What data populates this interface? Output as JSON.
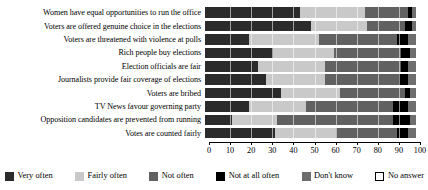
{
  "chart_data": {
    "type": "bar",
    "orientation": "horizontal",
    "stacked": true,
    "normalized_percent": true,
    "title": "",
    "subtitle": "",
    "xlabel": "",
    "ylabel": "",
    "xlim": [
      0,
      100
    ],
    "xticks": [
      0,
      10,
      20,
      30,
      40,
      50,
      60,
      70,
      80,
      90,
      100
    ],
    "xtick_labels": [
      "0",
      "10",
      "20",
      "30",
      "40",
      "50",
      "60",
      "70",
      "80",
      "90",
      "100"
    ],
    "grid": true,
    "legend_position": "bottom",
    "categories": [
      "Women have equal opportunities to run the office",
      "Voters are offered genuine choice in the elections",
      "Voters are threatened with violence at polls",
      "Rich people buy elections",
      "Election officials are fair",
      "Journalists provide fair coverage of elections",
      "Voters are bribed",
      "TV News favour governing party",
      "Opposition candidates are prevented from running",
      "Votes are counted fairly"
    ],
    "series": [
      {
        "name": "Very often",
        "color": "#2b2b2b",
        "values": [
          45,
          50,
          21,
          32,
          25,
          29,
          36,
          21,
          13,
          33
        ]
      },
      {
        "name": "Fairly often",
        "color": "#c9c9c9",
        "values": [
          31,
          27,
          33,
          29,
          32,
          28,
          28,
          27,
          21,
          29
        ]
      },
      {
        "name": "Not often",
        "color": "#616161",
        "values": [
          20,
          18,
          37,
          32,
          36,
          35,
          31,
          41,
          55,
          29
        ]
      },
      {
        "name": "Not at all often",
        "color": "#000000",
        "values": [
          2,
          3,
          5,
          4,
          3,
          4,
          2,
          7,
          8,
          5
        ]
      },
      {
        "name": "Don't know",
        "color": "#6e6e6e",
        "values": [
          2,
          2,
          4,
          3,
          4,
          4,
          3,
          4,
          3,
          4
        ]
      },
      {
        "name": "No answer",
        "color": "#ffffff",
        "values": [
          0,
          0,
          0,
          0,
          0,
          0,
          0,
          0,
          0,
          0
        ]
      }
    ]
  },
  "legend": {
    "items": [
      {
        "label": "Very often",
        "color": "#2b2b2b",
        "outline": false
      },
      {
        "label": "Fairly often",
        "color": "#c9c9c9",
        "outline": false
      },
      {
        "label": "Not often",
        "color": "#616161",
        "outline": false
      },
      {
        "label": "Not at all often",
        "color": "#000000",
        "outline": false
      },
      {
        "label": "Don't know",
        "color": "#6e6e6e",
        "outline": false
      },
      {
        "label": "No answer",
        "color": "#ffffff",
        "outline": true
      }
    ]
  }
}
